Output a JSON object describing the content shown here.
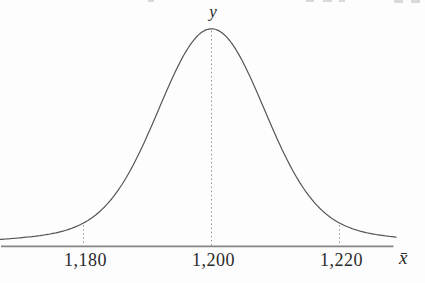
{
  "figure": {
    "y_axis_label": "y",
    "x_axis_label": "x̄",
    "tick_labels": [
      "1,180",
      "1,200",
      "1,220"
    ]
  },
  "chart_data": {
    "type": "line",
    "curve_kind": "normal_distribution_bell",
    "title": "",
    "xlabel": "x̄",
    "ylabel": "y",
    "mean": 1200,
    "x_tick_values": [
      1180,
      1200,
      1220
    ],
    "x_tick_labels": [
      "1,180",
      "1,200",
      "1,220"
    ],
    "dotted_guides_at_x": [
      1180,
      1200,
      1220
    ],
    "x_axis_range_shown": [
      1167,
      1228
    ],
    "peak": {
      "x": 1200,
      "relative_height": 1.0
    },
    "guide_relative_heights": [
      0.095,
      1.0,
      0.095
    ],
    "grid": "off",
    "legend_position": "none",
    "colors": {
      "curve": "#555555",
      "axis": "#858585",
      "guides": "#949494",
      "text": "#2b2b2b",
      "background": "#fdfdfd"
    }
  }
}
